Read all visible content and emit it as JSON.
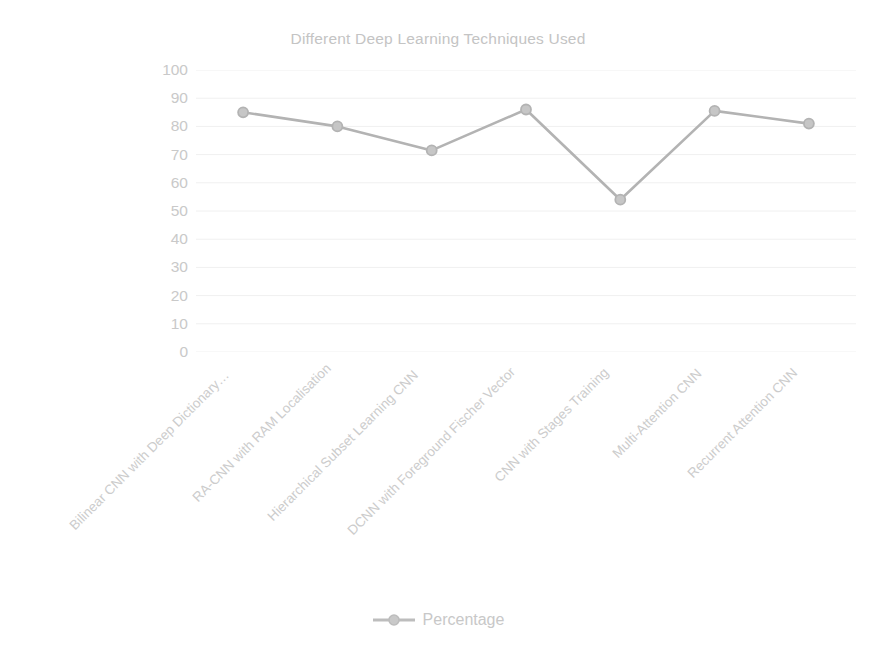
{
  "chart_data": {
    "type": "line",
    "title": "Different Deep Learning Techniques Used",
    "xlabel": "",
    "ylabel": "",
    "ylim": [
      0,
      100
    ],
    "yticks": [
      100,
      90,
      80,
      70,
      60,
      50,
      40,
      30,
      20,
      10,
      0
    ],
    "grid": true,
    "grid_axis": "y",
    "legend_position": "bottom",
    "categories": [
      "Bilinear CNN with Deep Dictionary…",
      "RA-CNN with RAM Localisation",
      "Hierarchical Subset Learning CNN",
      "DCNN with Foreground Fischer Vector",
      "CNN with Stages Training",
      "Multi-Attention CNN",
      "Recurrent Attention CNN"
    ],
    "series": [
      {
        "name": "Percentage",
        "values": [
          85,
          80,
          71.5,
          86,
          54,
          85.5,
          81
        ],
        "color": "#b3b3b3",
        "marker": "circle"
      }
    ]
  },
  "legend": {
    "entries": [
      {
        "label": "Percentage",
        "icon": "line-marker-swatch",
        "color": "#b3b3b3"
      }
    ]
  },
  "colors": {
    "series": "#b3b3b3",
    "title": "#c4c4c4",
    "tick_label": "#c9c9c9",
    "grid": "#f0f0f0",
    "background": "#ffffff"
  }
}
